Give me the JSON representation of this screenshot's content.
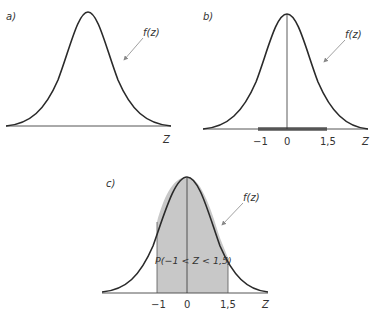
{
  "panels": [
    {
      "id": "a",
      "label": "a)",
      "curve_label": "f(z)",
      "axis_label": "Z",
      "ticks": []
    },
    {
      "id": "b",
      "label": "b)",
      "curve_label": "f(z)",
      "axis_label": "Z",
      "ticks": [
        "−1",
        "0",
        "1,5"
      ],
      "highlight_interval": [
        -1,
        1.5
      ]
    },
    {
      "id": "c",
      "label": "c)",
      "curve_label": "f(z)",
      "axis_label": "Z",
      "ticks": [
        "−1",
        "0",
        "1,5"
      ],
      "shaded_interval": [
        -1,
        1.5
      ],
      "area_label": "P(−1 < Z < 1,5)"
    }
  ],
  "colors": {
    "curve": "#2a2a2a",
    "shade": "#c8c8c8",
    "axis": "#555555",
    "arrow": "#888888"
  }
}
